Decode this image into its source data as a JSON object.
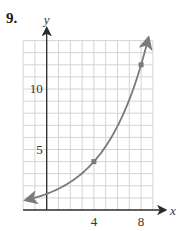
{
  "problem_number": "9.",
  "chart_data": {
    "type": "line",
    "title": "",
    "xlabel": "x",
    "ylabel": "y",
    "xlim": [
      -2,
      9
    ],
    "ylim": [
      0,
      14
    ],
    "grid": true,
    "grid_step": 1,
    "x_ticks": [
      {
        "value": 4,
        "label": "4"
      },
      {
        "value": 8,
        "label": "8"
      }
    ],
    "y_ticks": [
      {
        "value": 5,
        "label": "5"
      },
      {
        "value": 10,
        "label": "10"
      }
    ],
    "series": [
      {
        "name": "exponential curve",
        "function": "y = (4/3) * 3^(x/4)",
        "marked_points": [
          {
            "x": 4,
            "y": 4
          },
          {
            "x": 8,
            "y": 12
          }
        ],
        "arrows_both_ends": true
      }
    ]
  },
  "colors": {
    "curve": "#7a7a7a",
    "grid": "#d4d4d4",
    "axis": "#2b2b2b"
  }
}
